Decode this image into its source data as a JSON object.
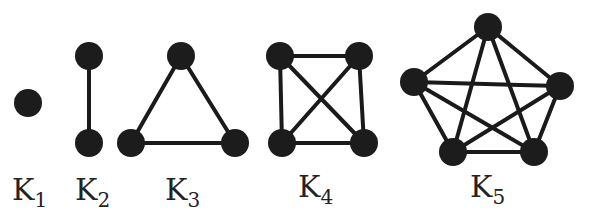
{
  "graphs": [
    {
      "label": "K",
      "sub": "1",
      "label_pos": [
        12,
        200
      ],
      "nodes": [
        [
          28,
          103
        ]
      ],
      "edges": []
    },
    {
      "label": "K",
      "sub": "2",
      "label_pos": [
        75,
        200
      ],
      "nodes": [
        [
          89,
          56
        ],
        [
          89,
          143
        ]
      ],
      "edges": [
        [
          0,
          1
        ]
      ]
    },
    {
      "label": "K",
      "sub": "3",
      "label_pos": [
        165,
        200
      ],
      "nodes": [
        [
          181,
          56
        ],
        [
          131,
          143
        ],
        [
          235,
          143
        ]
      ],
      "edges": [
        [
          0,
          1
        ],
        [
          0,
          2
        ],
        [
          1,
          2
        ]
      ]
    },
    {
      "label": "K",
      "sub": "4",
      "label_pos": [
        298,
        197
      ],
      "nodes": [
        [
          280,
          56
        ],
        [
          359,
          56
        ],
        [
          282,
          143
        ],
        [
          364,
          143
        ]
      ],
      "edges": [
        [
          0,
          1
        ],
        [
          0,
          2
        ],
        [
          0,
          3
        ],
        [
          1,
          2
        ],
        [
          1,
          3
        ],
        [
          2,
          3
        ]
      ]
    },
    {
      "label": "K",
      "sub": "5",
      "label_pos": [
        470,
        197
      ],
      "nodes": [
        [
          488,
          27
        ],
        [
          414,
          82
        ],
        [
          560,
          86
        ],
        [
          453,
          152
        ],
        [
          534,
          152
        ]
      ],
      "edges": [
        [
          0,
          1
        ],
        [
          0,
          2
        ],
        [
          0,
          3
        ],
        [
          0,
          4
        ],
        [
          1,
          2
        ],
        [
          1,
          3
        ],
        [
          1,
          4
        ],
        [
          2,
          3
        ],
        [
          2,
          4
        ],
        [
          3,
          4
        ]
      ]
    }
  ],
  "style": {
    "node_radius": 14,
    "node_color": "#1c1c1c",
    "edge_color": "#1a1a1a"
  }
}
